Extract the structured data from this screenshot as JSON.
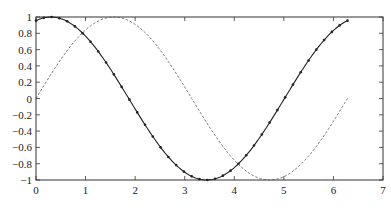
{
  "chart_data": {
    "type": "line",
    "title": "",
    "xlabel": "",
    "ylabel": "",
    "xlim": [
      0,
      7
    ],
    "ylim": [
      -1,
      1
    ],
    "grid": false,
    "legend": null,
    "x_ticks": [
      "0",
      "1",
      "2",
      "3",
      "4",
      "5",
      "6",
      "7"
    ],
    "y_ticks": [
      "1",
      "0.8",
      "0.6",
      "0.4",
      "0.2",
      "0",
      "-0.2",
      "-0.4",
      "-0.6",
      "-0.8",
      "-1"
    ],
    "series": [
      {
        "name": "solid line with dot markers",
        "style": "solid",
        "marker": "dot",
        "description": "cos(x - 0.3) sampled over 0 to 2π",
        "x": [
          0,
          0.785,
          1.571,
          2.356,
          3.142,
          3.44,
          3.927,
          4.712,
          5.498,
          6.283
        ],
        "values": [
          0.955,
          0.885,
          -0.296,
          -0.91,
          -0.955,
          -1.0,
          -0.885,
          0.296,
          0.91,
          0.955
        ]
      },
      {
        "name": "dashed line",
        "style": "dashed",
        "marker": "none",
        "description": "sin(x) over 0 to 2π",
        "x": [
          0,
          0.785,
          1.571,
          2.356,
          3.142,
          3.927,
          4.712,
          5.498,
          6.283
        ],
        "values": [
          0,
          0.707,
          1.0,
          0.707,
          0,
          -0.707,
          -1.0,
          -0.707,
          0
        ]
      }
    ]
  },
  "colors": {
    "axes": "#333333",
    "solid_line": "#222222",
    "dashed_line": "#555555",
    "background": "#ffffff"
  }
}
